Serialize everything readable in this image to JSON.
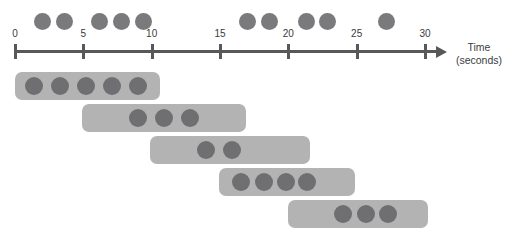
{
  "figure": {
    "axis_title_line1": "Time",
    "axis_title_line2": "(seconds)",
    "colors": {
      "axis": "#58585a",
      "event_dot": "#7a7a7c",
      "bar": "#b3b3b3",
      "bar_dot": "#6f6f71",
      "background": "#ffffff"
    }
  },
  "chart_data": {
    "type": "scatter",
    "xlabel": "Time (seconds)",
    "ylabel": "",
    "xlim": [
      0,
      30
    ],
    "grid": false,
    "legend": "none",
    "axis": {
      "ticks": [
        {
          "label": "0",
          "value": 0
        },
        {
          "label": "5",
          "value": 5
        },
        {
          "label": "10",
          "value": 10
        },
        {
          "label": "15",
          "value": 15
        },
        {
          "label": "20",
          "value": 20
        },
        {
          "label": "25",
          "value": 25
        },
        {
          "label": "30",
          "value": 30
        }
      ],
      "arrow": true
    },
    "series": [
      {
        "name": "events",
        "kind": "dots-above-axis",
        "x": [
          2.0,
          3.6,
          6.2,
          7.8,
          9.4,
          17.0,
          18.6,
          21.3,
          22.9,
          27.2
        ]
      },
      {
        "name": "windows",
        "kind": "bars-with-dots",
        "bars": [
          {
            "start": 0.0,
            "end": 10.6,
            "dots": [
              1.4,
              3.3,
              5.2,
              7.1,
              9.0
            ]
          },
          {
            "start": 4.9,
            "end": 16.9,
            "dots": [
              9.0,
              10.9,
              12.8
            ]
          },
          {
            "start": 9.9,
            "end": 21.6,
            "dots": [
              14.0,
              15.9
            ]
          },
          {
            "start": 14.9,
            "end": 24.9,
            "dots": [
              16.5,
              18.2,
              19.8,
              21.4
            ]
          },
          {
            "start": 20.0,
            "end": 30.2,
            "dots": [
              24.0,
              25.7,
              27.3
            ]
          }
        ]
      }
    ]
  }
}
